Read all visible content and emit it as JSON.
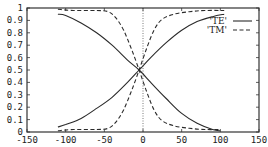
{
  "chart_data": {
    "type": "line",
    "title": "",
    "xlabel": "",
    "ylabel": "",
    "xlim": [
      -150,
      150
    ],
    "ylim": [
      0,
      1
    ],
    "grid": false,
    "legend_position": "upper-right-inside",
    "x_ticks": [
      -150,
      -100,
      -50,
      0,
      50,
      100,
      150
    ],
    "x_tick_labels": [
      "-150",
      "-100",
      "-50",
      "0",
      "50",
      "100",
      "150"
    ],
    "y_ticks": [
      0,
      0.1,
      0.2,
      0.3,
      0.4,
      0.5,
      0.6,
      0.7,
      0.8,
      0.9,
      1
    ],
    "y_tick_labels": [
      "0",
      "0.1",
      "0.2",
      "0.3",
      "0.4",
      "0.5",
      "0.6",
      "0.7",
      "0.8",
      "0.9",
      "1"
    ],
    "annotations": [
      {
        "type": "vertical-dotted-line",
        "x": 0
      }
    ],
    "series": [
      {
        "name": "'TE'",
        "style": "solid",
        "branch": "decreasing",
        "x": [
          -110,
          -100,
          -80,
          -60,
          -40,
          -20,
          -5,
          10,
          30,
          50,
          70,
          90,
          100
        ],
        "y": [
          0.95,
          0.94,
          0.88,
          0.8,
          0.7,
          0.58,
          0.5,
          0.4,
          0.27,
          0.15,
          0.07,
          0.02,
          0.01
        ]
      },
      {
        "name": "'TE'",
        "style": "solid",
        "branch": "increasing",
        "x": [
          -110,
          -100,
          -80,
          -60,
          -40,
          -20,
          -5,
          10,
          30,
          50,
          70,
          90,
          105
        ],
        "y": [
          0.04,
          0.06,
          0.11,
          0.19,
          0.28,
          0.4,
          0.5,
          0.6,
          0.72,
          0.82,
          0.89,
          0.93,
          0.95
        ]
      },
      {
        "name": "'TM'",
        "style": "dashed",
        "branch": "decreasing",
        "x": [
          -110,
          -90,
          -60,
          -45,
          -35,
          -25,
          -15,
          -5,
          5,
          15,
          25,
          40,
          60,
          80,
          100
        ],
        "y": [
          0.99,
          0.98,
          0.98,
          0.97,
          0.92,
          0.82,
          0.67,
          0.5,
          0.32,
          0.17,
          0.09,
          0.05,
          0.03,
          0.02,
          0.02
        ]
      },
      {
        "name": "'TM'",
        "style": "dashed",
        "branch": "increasing",
        "x": [
          -110,
          -90,
          -60,
          -45,
          -35,
          -25,
          -15,
          -5,
          5,
          15,
          25,
          40,
          60,
          80,
          105
        ],
        "y": [
          0.01,
          0.02,
          0.02,
          0.03,
          0.08,
          0.18,
          0.33,
          0.5,
          0.68,
          0.83,
          0.91,
          0.95,
          0.97,
          0.98,
          0.98
        ]
      }
    ]
  },
  "legend": {
    "items": [
      {
        "label": "'TE'",
        "style": "solid"
      },
      {
        "label": "'TM'",
        "style": "dashed"
      }
    ]
  },
  "colors": {
    "line": "#2a2a2a",
    "axis": "#333333",
    "background": "#ffffff"
  }
}
